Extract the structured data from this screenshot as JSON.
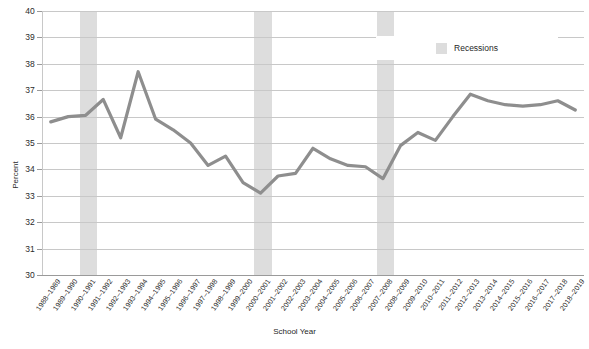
{
  "chart_data": {
    "type": "line",
    "title": "",
    "xlabel": "School Year",
    "ylabel": "Percent",
    "ylim": [
      30,
      40
    ],
    "yticks": [
      30,
      31,
      32,
      33,
      34,
      35,
      36,
      37,
      38,
      39,
      40
    ],
    "grid": true,
    "legend": {
      "position": "top-right",
      "entries": [
        {
          "label": "Recessions",
          "color": "#dddddd",
          "type": "band"
        }
      ]
    },
    "categories": [
      "1988–1989",
      "1989–1990",
      "1990–1991",
      "1991–1992",
      "1992–1993",
      "1993–1994",
      "1994–1995",
      "1995–1996",
      "1996–1997",
      "1997–1998",
      "1998–1999",
      "1999–2000",
      "2000–2001",
      "2001–2002",
      "2002–2003",
      "2003–2004",
      "2004–2005",
      "2005–2006",
      "2006–2007",
      "2007–2008",
      "2008–2009",
      "2009–2010",
      "2010–2011",
      "2011–2012",
      "2012–2013",
      "2013–2014",
      "2014–2015",
      "2015–2016",
      "2016–2017",
      "2017–2018",
      "2018–2019"
    ],
    "series": [
      {
        "name": "Percent",
        "color": "#8e8e8e",
        "values": [
          35.8,
          36.0,
          36.05,
          36.65,
          35.2,
          37.7,
          35.9,
          35.5,
          35.0,
          34.15,
          34.5,
          33.5,
          33.1,
          33.75,
          33.85,
          34.8,
          34.4,
          34.15,
          34.1,
          33.65,
          34.9,
          35.4,
          35.1,
          36.0,
          36.85,
          36.6,
          36.45,
          36.4,
          36.45,
          36.6,
          36.25
        ]
      }
    ],
    "recession_bands": [
      {
        "start": "1990–1991",
        "end": "1991–1992",
        "color": "#dddddd"
      },
      {
        "start": "2000–2001",
        "end": "2001–2002",
        "color": "#dddddd"
      },
      {
        "start": "2007–2008",
        "end": "2008–2009",
        "color": "#dddddd"
      }
    ]
  }
}
